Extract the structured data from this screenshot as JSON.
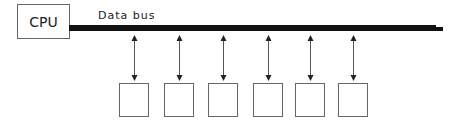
{
  "diagram": {
    "cpu": {
      "label": "CPU"
    },
    "bus": {
      "label": "Data bus"
    },
    "devices": [
      {
        "x": 119,
        "arrow_x": 134
      },
      {
        "x": 164,
        "arrow_x": 179
      },
      {
        "x": 208,
        "arrow_x": 223
      },
      {
        "x": 253,
        "arrow_x": 268
      },
      {
        "x": 295,
        "arrow_x": 310
      },
      {
        "x": 338,
        "arrow_x": 353
      }
    ],
    "colors": {
      "stroke": "#555555",
      "bus": "#111111",
      "background": "#ffffff"
    }
  }
}
